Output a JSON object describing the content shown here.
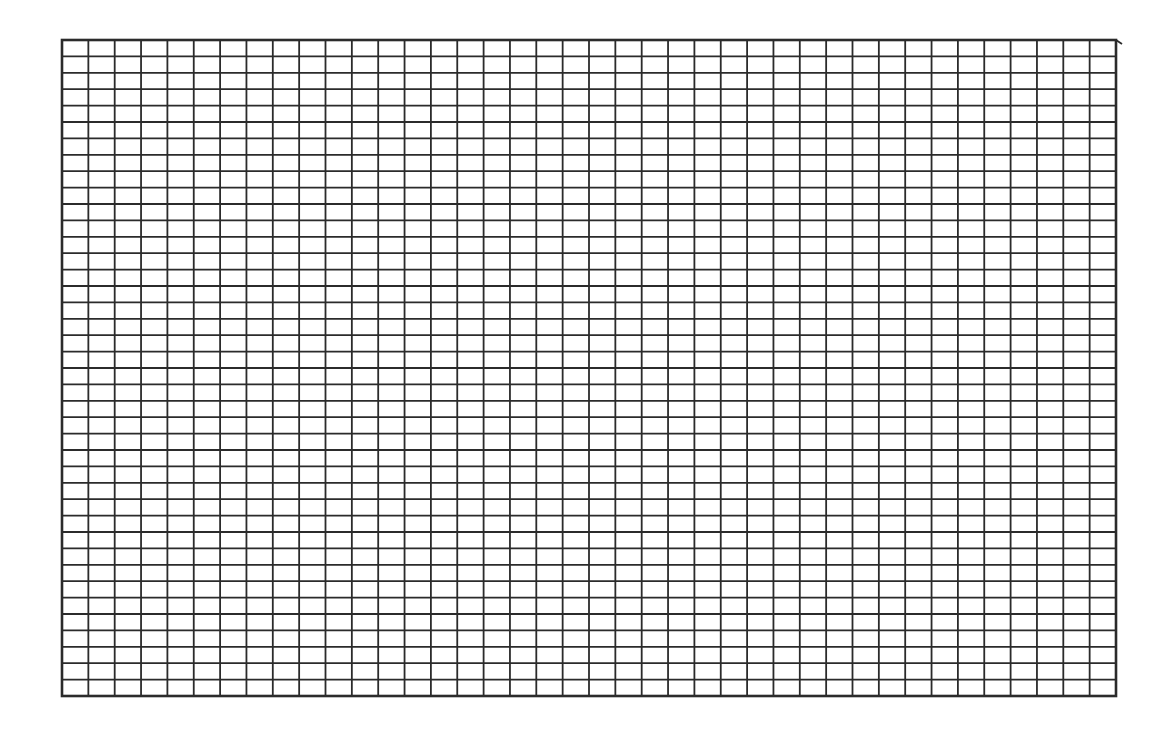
{
  "canvas": {
    "width": 1175,
    "height": 741,
    "background": "#ffffff"
  },
  "grid": {
    "left": 62,
    "top": 40,
    "right": 1116,
    "bottom": 696,
    "columns": 40,
    "rows": 40,
    "line_color": "#2b2b2b",
    "line_width": 1.8,
    "border_width": 2.6,
    "top_line_overhang_right": 1122,
    "top_line_right_y": 44
  }
}
